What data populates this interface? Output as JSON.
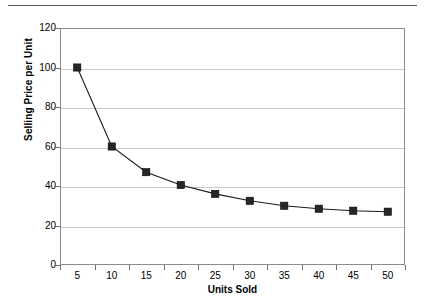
{
  "chart_data": {
    "type": "line",
    "title": "",
    "xlabel": "Units Sold",
    "ylabel": "Selling Price per Unit",
    "categories": [
      5,
      10,
      15,
      20,
      25,
      30,
      35,
      40,
      45,
      50
    ],
    "values": [
      100,
      60,
      47,
      40.5,
      36,
      32.5,
      30,
      28.5,
      27.5,
      27
    ],
    "series": [
      {
        "name": "Selling Price per Unit",
        "values": [
          100,
          60,
          47,
          40.5,
          36,
          32.5,
          30,
          28.5,
          27.5,
          27
        ]
      }
    ],
    "x_tick_labels": [
      "5",
      "10",
      "15",
      "20",
      "25",
      "30",
      "35",
      "40",
      "45",
      "50"
    ],
    "y_tick_labels": [
      "0",
      "20",
      "40",
      "60",
      "80",
      "100",
      "120"
    ],
    "y_ticks": [
      0,
      20,
      40,
      60,
      80,
      100,
      120
    ],
    "ylim": [
      0,
      120
    ],
    "grid": "horizontal",
    "legend": "none",
    "marker": "square",
    "marker_color": "#262626",
    "line_color": "#1a1a1a",
    "gridline_color": "#c9c9c9",
    "frame_color": "#8c8c8c",
    "background_color": "#ffffff"
  },
  "figure": {
    "x_axis_title": "Units Sold",
    "y_axis_title": "Selling Price per Unit"
  }
}
